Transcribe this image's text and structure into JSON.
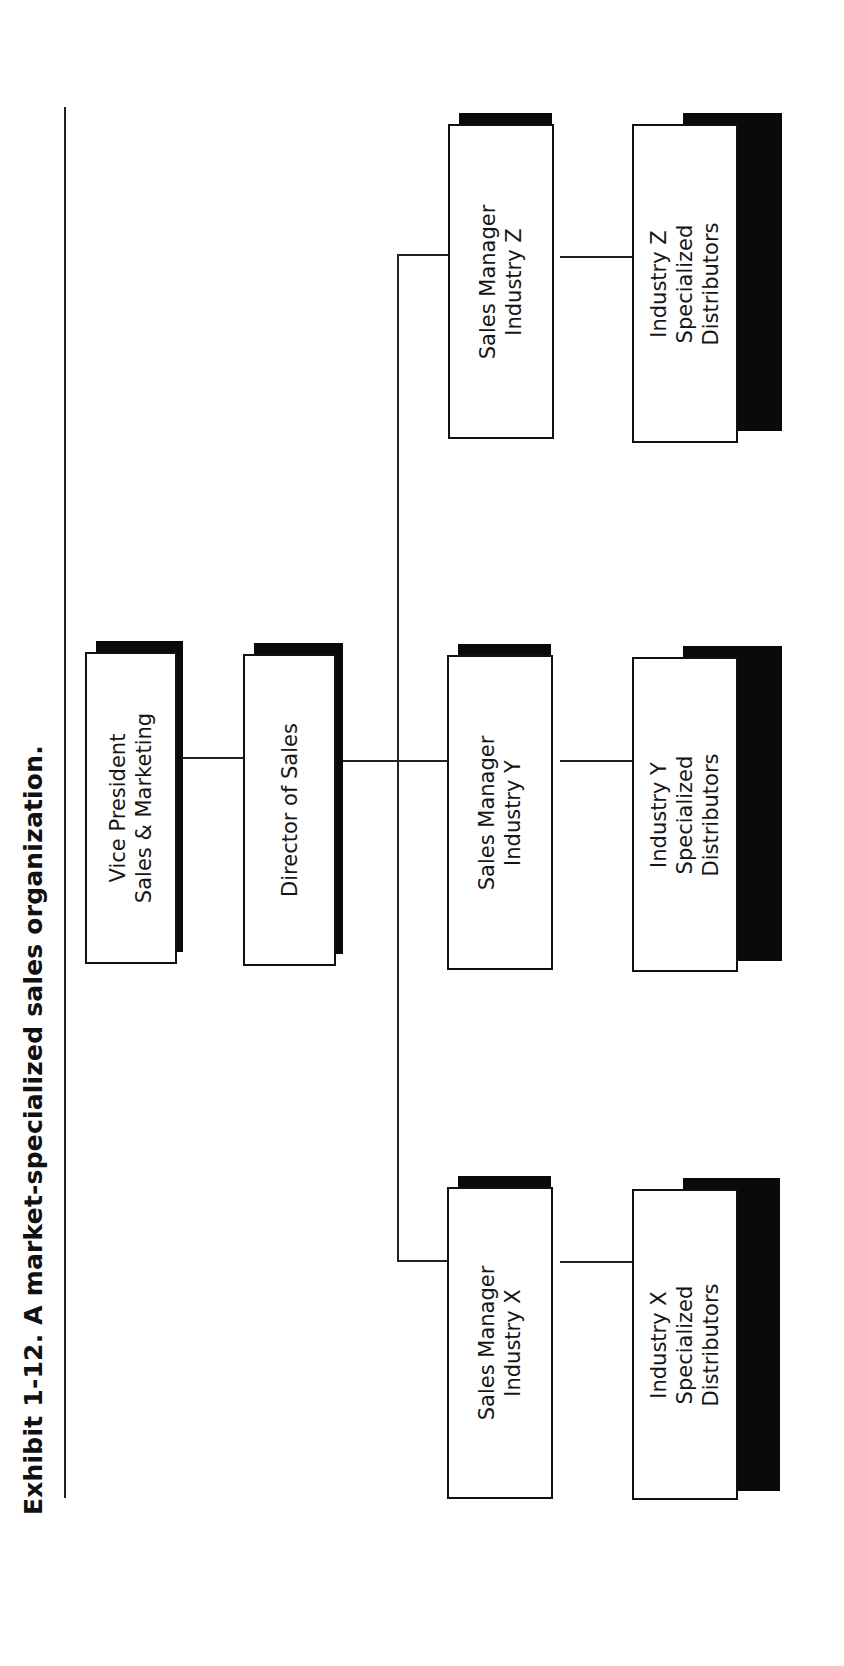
{
  "title": {
    "exhibit": "Exhibit 1-12.",
    "caption": "A market-specialized sales organization."
  },
  "nodes": {
    "vp": {
      "lines": [
        "Vice President",
        "Sales & Marketing"
      ]
    },
    "director": {
      "lines": [
        "Director of Sales"
      ]
    },
    "sm_x": {
      "lines": [
        "Sales Manager",
        "Industry X"
      ]
    },
    "sm_y": {
      "lines": [
        "Sales Manager",
        "Industry Y"
      ]
    },
    "sm_z": {
      "lines": [
        "Sales Manager",
        "Industry Z"
      ]
    },
    "dist_x": {
      "lines": [
        "Industry X",
        "Specialized",
        "Distributors"
      ]
    },
    "dist_y": {
      "lines": [
        "Industry Y",
        "Specialized",
        "Distributors"
      ]
    },
    "dist_z": {
      "lines": [
        "Industry Z",
        "Specialized",
        "Distributors"
      ]
    }
  },
  "hierarchy": {
    "root": "Vice President Sales & Marketing",
    "children": [
      {
        "name": "Director of Sales",
        "children": [
          {
            "name": "Sales Manager Industry X",
            "children": [
              {
                "name": "Industry X Specialized Distributors"
              }
            ]
          },
          {
            "name": "Sales Manager Industry Y",
            "children": [
              {
                "name": "Industry Y Specialized Distributors"
              }
            ]
          },
          {
            "name": "Sales Manager Industry Z",
            "children": [
              {
                "name": "Industry Z Specialized Distributors"
              }
            ]
          }
        ]
      }
    ]
  },
  "colors": {
    "ink": "#111111",
    "shadow": "#0a0a0a",
    "background": "#ffffff"
  }
}
